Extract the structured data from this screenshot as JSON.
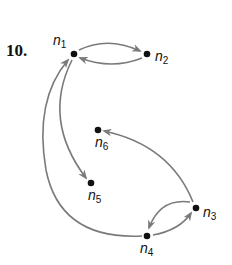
{
  "problem": {
    "number": "10."
  },
  "graph": {
    "type": "directed",
    "edge_color": "#7a7a7a",
    "node_color": "#111111",
    "nodes": [
      {
        "id": "n1",
        "label": "n",
        "sub": "1"
      },
      {
        "id": "n2",
        "label": "n",
        "sub": "2"
      },
      {
        "id": "n3",
        "label": "n",
        "sub": "3"
      },
      {
        "id": "n4",
        "label": "n",
        "sub": "4"
      },
      {
        "id": "n5",
        "label": "n",
        "sub": "5"
      },
      {
        "id": "n6",
        "label": "n",
        "sub": "6"
      }
    ],
    "edges": [
      {
        "from": "n1",
        "to": "n2"
      },
      {
        "from": "n2",
        "to": "n1"
      },
      {
        "from": "n1",
        "to": "n5"
      },
      {
        "from": "n4",
        "to": "n1"
      },
      {
        "from": "n3",
        "to": "n6"
      },
      {
        "from": "n3",
        "to": "n4"
      },
      {
        "from": "n4",
        "to": "n3"
      }
    ]
  }
}
